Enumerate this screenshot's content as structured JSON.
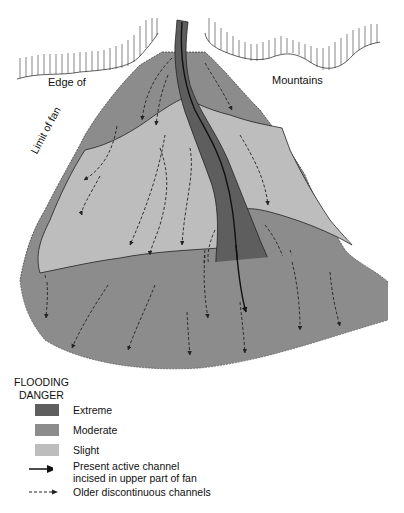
{
  "diagram": {
    "labels": {
      "edge_of": "Edge of",
      "mountains": "Mountains",
      "limit_of_fan": "Limit of fan"
    },
    "colors": {
      "extreme": "#5e5e5e",
      "moderate": "#8c8c8c",
      "slight": "#bdbdbd",
      "outline": "#222222",
      "background": "#ffffff"
    }
  },
  "legend": {
    "title_line1": "FLOODING",
    "title_line2": "DANGER",
    "items": [
      {
        "label": "Extreme",
        "type": "swatch",
        "color": "#5e5e5e"
      },
      {
        "label": "Moderate",
        "type": "swatch",
        "color": "#8c8c8c"
      },
      {
        "label": "Slight",
        "type": "swatch",
        "color": "#bdbdbd"
      },
      {
        "label_line1": "Present active channel",
        "label_line2": "incised in upper part of fan",
        "type": "solid-arrow"
      },
      {
        "label": "Older discontinuous channels",
        "type": "dashed-arrow"
      }
    ]
  }
}
